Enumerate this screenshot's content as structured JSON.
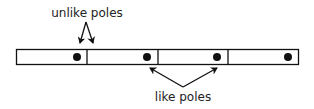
{
  "diagram": {
    "type": "magnet-chain",
    "labels": {
      "top": "unlike poles",
      "bottom": "like poles"
    },
    "magnets": [
      {
        "index": 1,
        "dot_position": "right"
      },
      {
        "index": 2,
        "dot_position": "right"
      },
      {
        "index": 3,
        "dot_position": "right"
      },
      {
        "index": 4,
        "dot_position": "right"
      }
    ],
    "colors": {
      "stroke": "#111111",
      "fill": "#ffffff",
      "text": "#222222"
    }
  }
}
